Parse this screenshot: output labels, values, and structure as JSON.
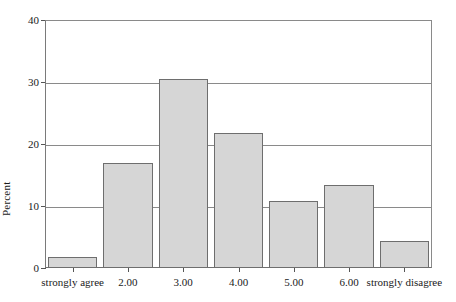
{
  "chart_data": {
    "type": "bar",
    "title": "",
    "xlabel": "",
    "ylabel": "Percent",
    "categories": [
      "strongly agree",
      "2.00",
      "3.00",
      "4.00",
      "5.00",
      "6.00",
      "strongly disagree"
    ],
    "values": [
      1.7,
      17.0,
      30.5,
      21.8,
      10.8,
      13.4,
      4.4
    ],
    "ylim": [
      0,
      40
    ],
    "yticks": [
      0,
      10,
      20,
      30,
      40
    ],
    "ytick_labels": [
      "0",
      "10",
      "20",
      "30",
      "40"
    ],
    "grid": "horizontal",
    "legend": "none",
    "bar_fill_color": "#d6d6d6",
    "bar_border_color": "#6e6e6e",
    "axis_color": "#8a8a8a",
    "text_color": "#1a1a1a"
  }
}
